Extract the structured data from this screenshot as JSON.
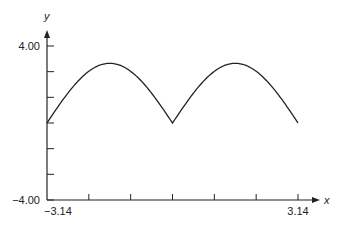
{
  "chart_data": {
    "type": "line",
    "title": "",
    "xlabel": "x",
    "ylabel": "y",
    "xlim": [
      -3.14,
      3.14
    ],
    "ylim": [
      -4.0,
      4.0
    ],
    "x_tick_labels": [
      "-3.14",
      "3.14"
    ],
    "y_tick_labels": [
      "4.00",
      "-4.00"
    ],
    "x_ticks_count": 6,
    "y_ticks_count": 6,
    "grid": false,
    "legend": null,
    "series": [
      {
        "name": "y = 3|sin x|",
        "x": [
          -3.14,
          -2.62,
          -2.09,
          -1.57,
          -1.05,
          -0.52,
          0.0,
          0.52,
          1.05,
          1.57,
          2.09,
          2.62,
          3.14
        ],
        "y": [
          0.0,
          1.5,
          2.6,
          3.1,
          2.6,
          1.5,
          0.0,
          1.5,
          2.6,
          3.1,
          2.6,
          1.5,
          0.0
        ]
      }
    ]
  },
  "labels": {
    "y_axis": "y",
    "x_axis": "x",
    "y_max": "4.00",
    "y_min": "−4.00",
    "x_min": "−3.14",
    "x_max": "3.14"
  }
}
